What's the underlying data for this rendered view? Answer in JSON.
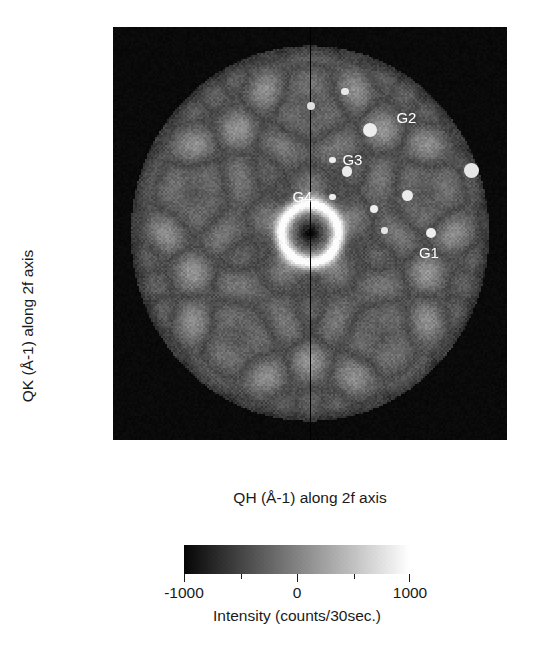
{
  "figure": {
    "type": "diffraction-pattern-image-plot"
  },
  "axes": {
    "x": {
      "label": "QH (Å-1) along 2f axis",
      "major_ticks": [
        "-4.0",
        "-2.0",
        "0.0",
        "2.0",
        "4.0"
      ],
      "major_values": [
        -4,
        -2,
        0,
        2,
        4
      ],
      "minor_values": [
        -3,
        -1,
        1,
        3
      ],
      "range": [
        -4.4,
        4.4
      ]
    },
    "y": {
      "label": "QK (Å-1) along 2f axis",
      "major_ticks": [
        "4.0",
        "2.0",
        "0.0",
        "-2.0",
        "-4.0"
      ],
      "major_values": [
        4,
        2,
        0,
        -2,
        -4
      ],
      "minor_values": [
        3,
        1,
        -1,
        -3
      ],
      "range": [
        -4.4,
        4.4
      ]
    }
  },
  "colorbar": {
    "title": "Intensity (counts/30sec.)",
    "ticks": [
      "-1000",
      "0",
      "1000"
    ],
    "tick_values": [
      -1000,
      0,
      1000
    ],
    "minor_values": [
      -500,
      500
    ],
    "min_color": "#060606",
    "max_color": "#ffffff",
    "range": [
      -1000,
      1000
    ]
  },
  "markers": [
    {
      "name": "g2",
      "label": "G2",
      "qh": 1.35,
      "qk": 2.2,
      "r": 7.0,
      "label_dx": 26,
      "label_dy": -20,
      "color": "#ededed"
    },
    {
      "name": "g3",
      "label": "G3",
      "qh": 0.5,
      "qk": 1.56,
      "r": 3.2,
      "label_dx": 10,
      "label_dy": -8,
      "color": "#ededed"
    },
    {
      "name": "g4",
      "label": "G4",
      "qh": 0.5,
      "qk": 0.78,
      "r": 3.2,
      "label_dx": -40,
      "label_dy": -8,
      "color": "#ededed"
    },
    {
      "name": "g1",
      "label": "G1",
      "qh": 2.7,
      "qk": 0.02,
      "r": 5.0,
      "label_dx": -12,
      "label_dy": 12,
      "color": "#ededed"
    },
    {
      "name": "s-top-axis",
      "label": "",
      "qh": 0.02,
      "qk": 2.72,
      "r": 4.2,
      "label_dx": 0,
      "label_dy": 0,
      "color": "#e0e0e0"
    },
    {
      "name": "s-upper-right",
      "label": "",
      "qh": 0.78,
      "qk": 3.02,
      "r": 3.6,
      "label_dx": 0,
      "label_dy": 0,
      "color": "#e8e8e8"
    },
    {
      "name": "s-far-right",
      "label": "",
      "qh": 3.6,
      "qk": 1.34,
      "r": 7.5,
      "label_dx": 0,
      "label_dy": 0,
      "color": "#e6e6e6"
    },
    {
      "name": "s-mid-right",
      "label": "",
      "qh": 0.82,
      "qk": 1.32,
      "r": 5.2,
      "label_dx": 0,
      "label_dy": 0,
      "color": "#ebebeb"
    },
    {
      "name": "s-right-08",
      "label": "",
      "qh": 2.18,
      "qk": 0.8,
      "r": 5.5,
      "label_dx": 0,
      "label_dy": 0,
      "color": "#ebebeb"
    },
    {
      "name": "s-mid-05",
      "label": "",
      "qh": 1.42,
      "qk": 0.52,
      "r": 4.0,
      "label_dx": 0,
      "label_dy": 0,
      "color": "#ededed"
    },
    {
      "name": "s-mid-01",
      "label": "",
      "qh": 1.66,
      "qk": 0.06,
      "r": 3.2,
      "label_dx": 0,
      "label_dy": 0,
      "color": "#e4e4e4"
    }
  ],
  "chart_data": {
    "type": "heatmap",
    "title": "",
    "xlabel": "QH (Å-1) along 2f axis",
    "ylabel": "QK (Å-1) along 2f axis",
    "xlim": [
      -4.4,
      4.4
    ],
    "ylim": [
      -4.4,
      4.4
    ],
    "grid": false,
    "colorbar_label": "Intensity (counts/30sec.)",
    "colorbar_range": [
      -1000,
      1000
    ],
    "annotations": [
      {
        "text": "G1",
        "x": 2.7,
        "y": 0.02
      },
      {
        "text": "G2",
        "x": 1.35,
        "y": 2.2
      },
      {
        "text": "G3",
        "x": 0.5,
        "y": 1.56
      },
      {
        "text": "G4",
        "x": 0.5,
        "y": 0.78
      }
    ],
    "detector_radius": 4.0,
    "beamstop_center": [
      0.0,
      0.0
    ]
  }
}
